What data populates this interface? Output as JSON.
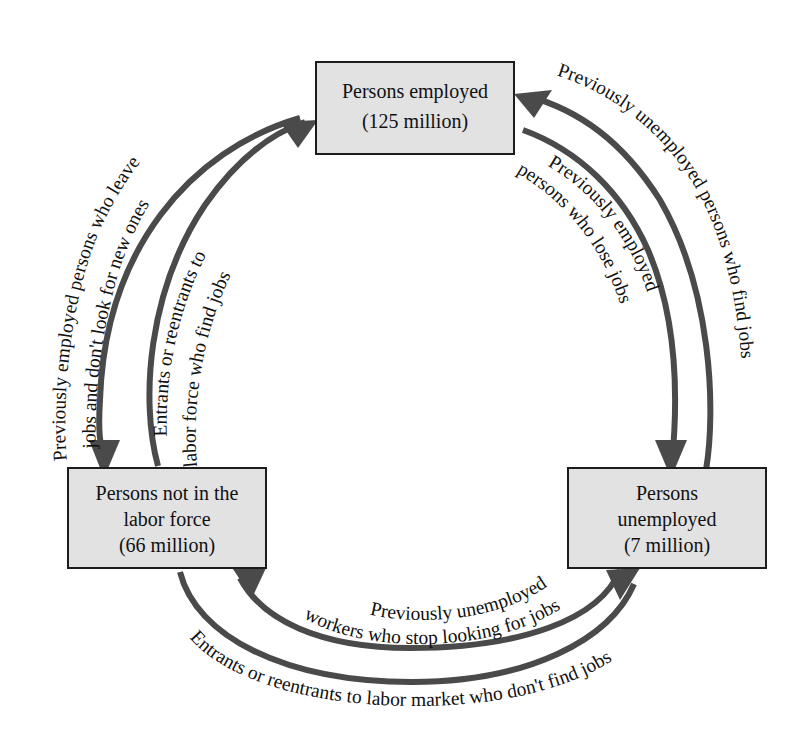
{
  "diagram": {
    "type": "cycle-flow-diagram",
    "colors": {
      "box_fill": "#e2e2e2",
      "box_border": "#1c1c1c",
      "arrow": "#4a4a4a",
      "text": "#111111",
      "background": "#ffffff"
    },
    "boxes": [
      {
        "id": "employed",
        "position": "top",
        "lines": [
          "Persons employed",
          "(125 million)"
        ],
        "line1": "Persons employed",
        "line2": "(125 million)",
        "value": "125 million"
      },
      {
        "id": "not-in-labor-force",
        "position": "bottom-left",
        "lines": [
          "Persons not in the",
          "labor force",
          "(66 million)"
        ],
        "line1": "Persons not in the",
        "line2": "labor force",
        "line3": "(66 million)",
        "value": "66 million"
      },
      {
        "id": "unemployed",
        "position": "bottom-right",
        "lines": [
          "Persons",
          "unemployed",
          "(7 million)"
        ],
        "line1": "Persons",
        "line2": "unemployed",
        "line3": "(7 million)",
        "value": "7 million"
      }
    ],
    "flows": [
      {
        "id": "employed-to-nilf",
        "from": "employed",
        "to": "not-in-labor-force",
        "side": "left-outer",
        "label": "Previously employed persons who leave jobs and don't look for new ones"
      },
      {
        "id": "nilf-to-employed",
        "from": "not-in-labor-force",
        "to": "employed",
        "side": "left-inner",
        "label": "Entrants or reentrants to labor force who find jobs"
      },
      {
        "id": "unemployed-to-employed",
        "from": "unemployed",
        "to": "employed",
        "side": "right-outer",
        "label": "Previously unemployed persons who find jobs"
      },
      {
        "id": "employed-to-unemployed",
        "from": "employed",
        "to": "unemployed",
        "side": "right-inner",
        "label": "Previously employed persons who lose jobs"
      },
      {
        "id": "unemployed-to-nilf",
        "from": "unemployed",
        "to": "not-in-labor-force",
        "side": "bottom-inner",
        "label": "Previously unemployed workers who stop looking for jobs"
      },
      {
        "id": "nilf-to-unemployed",
        "from": "not-in-labor-force",
        "to": "unemployed",
        "side": "bottom-outer",
        "label": "Entrants or reentrants to labor market who don't find jobs"
      }
    ],
    "arc_labels": {
      "left_outer_line1": "Previously employed persons who leave",
      "left_outer_line2": "jobs and don't look for new ones",
      "left_inner_line1": "Entrants or reentrants to",
      "left_inner_line2": "labor force who find jobs",
      "right_outer": "Previously unemployed persons who find jobs",
      "right_inner_line1": "Previously employed",
      "right_inner_line2": "persons who lose jobs",
      "bottom_inner_line1": "Previously unemployed",
      "bottom_inner_line2": "workers who stop looking for jobs",
      "bottom_outer": "Entrants or reentrants to labor market who don't find jobs"
    }
  }
}
